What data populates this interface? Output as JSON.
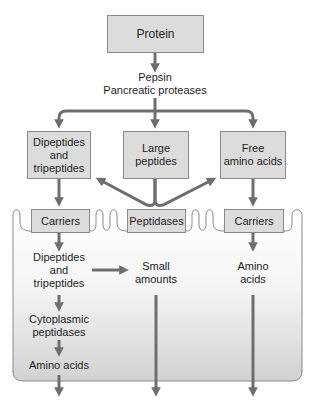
{
  "diagram": {
    "colors": {
      "box_fill": "#dcdcdc",
      "box_border": "#8a8a8a",
      "arrow": "#6e6e6e",
      "membrane": "#8a8a8a",
      "cell_top": "#ffffff",
      "cell_bottom": "#d4d4d4",
      "text": "#1e1e1e"
    },
    "nodes": {
      "protein": "Protein",
      "enzymes": "Pepsin\nPancreatic proteases",
      "di_tri_lumen": "Dipeptides\nand\ntripeptides",
      "large_peptides": "Large\npeptides",
      "free_amino_acids": "Free\namino acids",
      "carriers_left": "Carriers",
      "peptidases": "Peptidases",
      "carriers_right": "Carriers",
      "di_tri_cell": "Dipeptides\nand\ntripeptides",
      "small_amounts": "Small\namounts",
      "amino_acids_right": "Amino\nacids",
      "cytoplasmic_peptidases": "Cytoplasmic\npeptidases",
      "amino_acids_left": "Amino acids"
    },
    "edges": [
      {
        "from": "protein",
        "to": "enzymes"
      },
      {
        "from": "enzymes",
        "to": "di_tri_lumen"
      },
      {
        "from": "enzymes",
        "to": "large_peptides"
      },
      {
        "from": "enzymes",
        "to": "free_amino_acids"
      },
      {
        "from": "di_tri_lumen",
        "to": "carriers_left"
      },
      {
        "from": "peptidases",
        "to": "di_tri_lumen"
      },
      {
        "from": "peptidases",
        "to": "free_amino_acids"
      },
      {
        "from": "large_peptides",
        "to": "peptidases"
      },
      {
        "from": "free_amino_acids",
        "to": "carriers_right"
      },
      {
        "from": "carriers_left",
        "to": "di_tri_cell"
      },
      {
        "from": "di_tri_cell",
        "to": "small_amounts"
      },
      {
        "from": "di_tri_cell",
        "to": "cytoplasmic_peptidases"
      },
      {
        "from": "cytoplasmic_peptidases",
        "to": "amino_acids_left"
      },
      {
        "from": "carriers_right",
        "to": "amino_acids_right"
      },
      {
        "from": "amino_acids_left",
        "to": "exit"
      },
      {
        "from": "small_amounts",
        "to": "exit"
      },
      {
        "from": "amino_acids_right",
        "to": "exit"
      }
    ]
  }
}
